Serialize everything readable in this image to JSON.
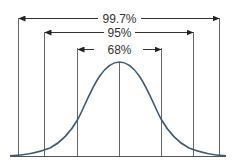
{
  "diagram": {
    "type": "normal-distribution-empirical-rule",
    "curve_color": "#3d5a73",
    "line_color": "#555555",
    "ranges": [
      {
        "label": "99.7%",
        "sigma": 3
      },
      {
        "label": "95%",
        "sigma": 2
      },
      {
        "label": "68%",
        "sigma": 1
      }
    ]
  }
}
